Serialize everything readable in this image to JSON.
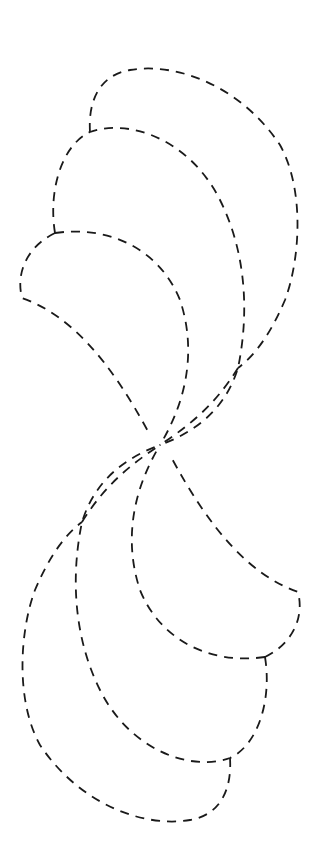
{
  "figure": {
    "stroke_color": "#1a1a1a",
    "background_color": "#ffffff",
    "dash_pattern": "9 7",
    "center": [
      160,
      445
    ],
    "upper_group": {
      "petals": [
        {
          "name": "upper-large",
          "path": "M90,132 C88,100 100,75 130,70 C175,62 240,85 280,145 C305,190 300,260 285,300 C270,335 255,355 238,368"
        },
        {
          "name": "upper-middle",
          "path": "M55,233 C48,190 62,145 90,132 C130,118 190,140 220,200 C245,250 250,310 238,368 C225,410 195,432 160,445"
        },
        {
          "name": "upper-small",
          "path": "M55,233 C30,245 15,270 22,298 C70,315 110,360 150,435 M55,233 C110,225 160,250 180,300 C195,345 190,395 160,445"
        }
      ],
      "outer_tail": "M238,368 C215,405 190,425 160,445"
    },
    "lower_group": {
      "petals": [
        {
          "name": "lower-large",
          "path": "M230,758 C232,790 220,815 190,820 C145,828 80,805 40,745 C15,700 20,630 35,590 C50,555 65,535 82,522"
        },
        {
          "name": "lower-middle",
          "path": "M265,657 C272,700 258,745 230,758 C190,772 130,750 100,690 C75,640 70,580 82,522 C95,480 125,458 160,445"
        },
        {
          "name": "lower-small",
          "path": "M265,657 C290,645 305,620 298,592 C250,575 210,530 170,455 M265,657 C210,665 160,640 140,590 C125,545 130,495 160,445"
        }
      ],
      "outer_tail": "M82,522 C105,485 130,465 160,445"
    }
  }
}
